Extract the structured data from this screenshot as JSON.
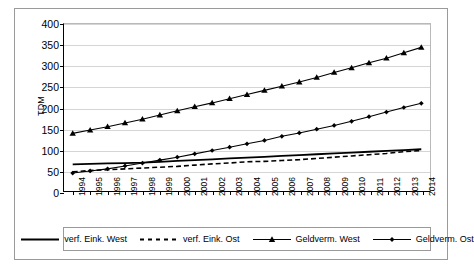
{
  "chart_data": {
    "type": "line",
    "title": "",
    "xlabel": "",
    "ylabel": "TDM",
    "ylim": [
      0,
      400
    ],
    "yticks": [
      0,
      50,
      100,
      150,
      200,
      250,
      300,
      350,
      400
    ],
    "grid": true,
    "legend_position": "bottom",
    "categories": [
      "1994",
      "1995",
      "1996",
      "1997",
      "1998",
      "1999",
      "2000",
      "2001",
      "2002",
      "2003",
      "2004",
      "2005",
      "2006",
      "2007",
      "2008",
      "2009",
      "2010",
      "2011",
      "2012",
      "2013",
      "2014"
    ],
    "series": [
      {
        "name": "verf. Eink. West",
        "style": "solid",
        "marker": "none",
        "color": "#000000",
        "values": [
          64,
          65,
          66,
          67,
          68,
          70,
          72,
          74,
          76,
          78,
          80,
          82,
          84,
          86,
          88,
          90,
          92,
          94,
          96,
          98,
          100
        ]
      },
      {
        "name": "verf. Eink. Ost",
        "style": "dashed",
        "marker": "none",
        "color": "#000000",
        "values": [
          46,
          49,
          51,
          53,
          55,
          57,
          59,
          62,
          65,
          67,
          70,
          71,
          73,
          75,
          78,
          81,
          84,
          87,
          90,
          94,
          97
        ]
      },
      {
        "name": "Geldverm. West",
        "style": "solid",
        "marker": "triangle",
        "color": "#000000",
        "values": [
          138,
          146,
          154,
          163,
          172,
          182,
          192,
          202,
          211,
          221,
          231,
          241,
          251,
          261,
          272,
          284,
          295,
          307,
          318,
          331,
          344
        ]
      },
      {
        "name": "Geldverm. Ost",
        "style": "solid",
        "marker": "diamond",
        "color": "#000000",
        "values": [
          43,
          48,
          53,
          60,
          67,
          74,
          81,
          89,
          97,
          105,
          113,
          121,
          131,
          139,
          148,
          157,
          167,
          178,
          189,
          200,
          210
        ]
      }
    ]
  }
}
